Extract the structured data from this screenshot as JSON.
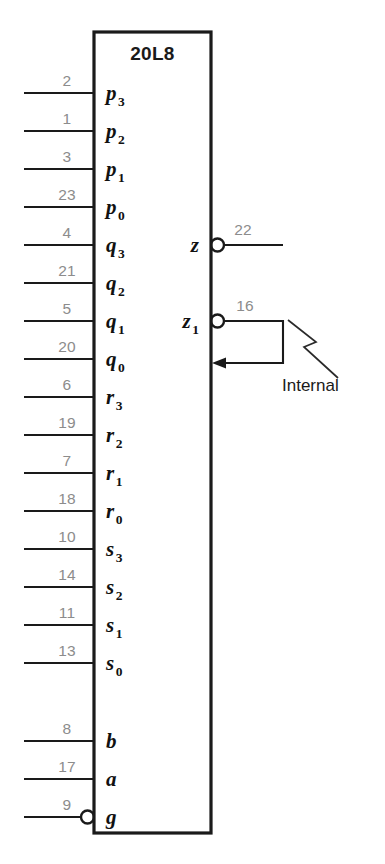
{
  "diagram": {
    "chip": {
      "label": "20L8",
      "box": {
        "x": 94,
        "y": 32,
        "width": 117,
        "height": 801
      }
    },
    "colors": {
      "outline": "#1a1a1a",
      "pin_number": "#8c8c8c",
      "signal": "#111111",
      "background": "#ffffff"
    },
    "inputs": [
      {
        "pin": "2",
        "signal": "p",
        "sub": "3",
        "y": 93,
        "bubble": false
      },
      {
        "pin": "1",
        "signal": "p",
        "sub": "2",
        "y": 131,
        "bubble": false
      },
      {
        "pin": "3",
        "signal": "p",
        "sub": "1",
        "y": 169,
        "bubble": false
      },
      {
        "pin": "23",
        "signal": "p",
        "sub": "0",
        "y": 207,
        "bubble": false
      },
      {
        "pin": "4",
        "signal": "q",
        "sub": "3",
        "y": 245,
        "bubble": false
      },
      {
        "pin": "21",
        "signal": "q",
        "sub": "2",
        "y": 283,
        "bubble": false
      },
      {
        "pin": "5",
        "signal": "q",
        "sub": "1",
        "y": 321,
        "bubble": false
      },
      {
        "pin": "20",
        "signal": "q",
        "sub": "0",
        "y": 359,
        "bubble": false
      },
      {
        "pin": "6",
        "signal": "r",
        "sub": "3",
        "y": 397,
        "bubble": false
      },
      {
        "pin": "19",
        "signal": "r",
        "sub": "2",
        "y": 435,
        "bubble": false
      },
      {
        "pin": "7",
        "signal": "r",
        "sub": "1",
        "y": 473,
        "bubble": false
      },
      {
        "pin": "18",
        "signal": "r",
        "sub": "0",
        "y": 511,
        "bubble": false
      },
      {
        "pin": "10",
        "signal": "s",
        "sub": "3",
        "y": 549,
        "bubble": false
      },
      {
        "pin": "14",
        "signal": "s",
        "sub": "2",
        "y": 587,
        "bubble": false
      },
      {
        "pin": "11",
        "signal": "s",
        "sub": "1",
        "y": 625,
        "bubble": false
      },
      {
        "pin": "13",
        "signal": "s",
        "sub": "0",
        "y": 663,
        "bubble": false
      },
      {
        "pin": "8",
        "signal": "b",
        "sub": "",
        "y": 741,
        "bubble": false
      },
      {
        "pin": "17",
        "signal": "a",
        "sub": "",
        "y": 779,
        "bubble": false
      },
      {
        "pin": "9",
        "signal": "g",
        "sub": "",
        "y": 817,
        "bubble": true
      }
    ],
    "outputs": [
      {
        "pin": "22",
        "signal": "z",
        "sub": "",
        "y": 245,
        "bubble": true,
        "feedback": false
      },
      {
        "pin": "16",
        "signal": "z",
        "sub": "1",
        "y": 321,
        "bubble": true,
        "feedback": true
      }
    ],
    "annotation": {
      "label": "Internal",
      "x": 282,
      "y": 391
    }
  }
}
